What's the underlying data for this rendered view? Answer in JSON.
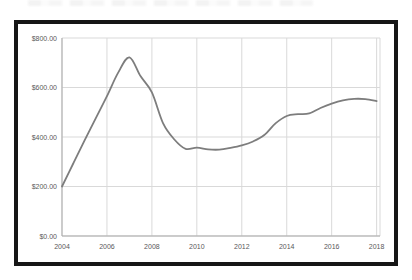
{
  "page": {
    "background_color": "#ffffff",
    "frame_border_color": "#161616"
  },
  "chart_data": {
    "type": "line",
    "title": "",
    "xlabel": "",
    "ylabel": "",
    "series_name": "price-over-time",
    "x": [
      2004,
      2004.5,
      2005,
      2005.5,
      2006,
      2006.5,
      2007,
      2007.5,
      2008,
      2008.5,
      2009,
      2009.5,
      2010,
      2010.5,
      2011,
      2011.5,
      2012,
      2012.5,
      2013,
      2013.5,
      2014,
      2014.5,
      2015,
      2015.5,
      2016,
      2016.5,
      2017,
      2017.5,
      2018
    ],
    "values": [
      200,
      293,
      385,
      475,
      565,
      660,
      722,
      645,
      580,
      455,
      390,
      352,
      357,
      350,
      349,
      356,
      366,
      382,
      408,
      455,
      485,
      492,
      495,
      517,
      535,
      548,
      554,
      553,
      545
    ],
    "x_tick_values": [
      2004,
      2006,
      2008,
      2010,
      2012,
      2014,
      2016,
      2018
    ],
    "x_tick_labels": [
      "2004",
      "2006",
      "2008",
      "2010",
      "2012",
      "2014",
      "2016",
      "2018"
    ],
    "y_tick_values": [
      0,
      200,
      400,
      600,
      800
    ],
    "y_tick_labels": [
      "$0.00",
      "$200.00",
      "$400.00",
      "$600.00",
      "$800.00"
    ],
    "xlim": [
      2004,
      2018.15
    ],
    "ylim": [
      0,
      800
    ],
    "grid": true,
    "legend": false,
    "line_color": "#7d7d7d",
    "grid_color": "#d9d9d9",
    "axis_color": "#ababab",
    "tick_label_color": "#595959"
  }
}
